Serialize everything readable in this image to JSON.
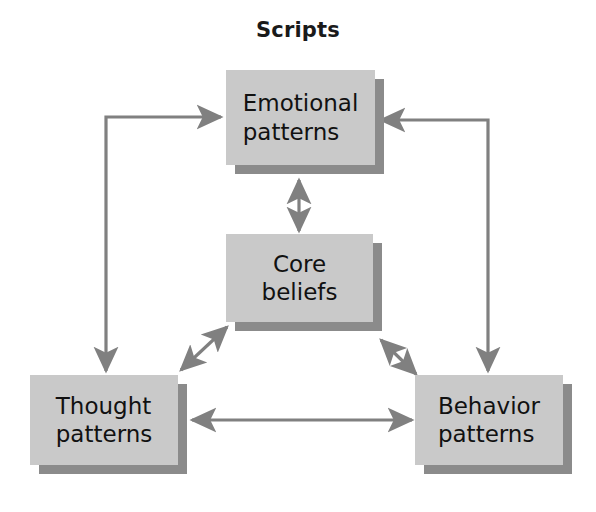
{
  "diagram": {
    "title": "Scripts",
    "type": "cycle-diagram",
    "colors": {
      "box_fill": "#c9c9c9",
      "box_shadow": "#8b8b8b",
      "arrow": "#808080",
      "text": "#111111",
      "background": "#ffffff"
    },
    "nodes": [
      {
        "id": "emotional",
        "label": "Emotional\npatterns",
        "x": 226,
        "y": 70,
        "width": 149,
        "height": 95
      },
      {
        "id": "core",
        "label": "Core\nbeliefs",
        "x": 226,
        "y": 234,
        "width": 147,
        "height": 88
      },
      {
        "id": "thought",
        "label": "Thought\npatterns",
        "x": 30,
        "y": 375,
        "width": 148,
        "height": 90
      },
      {
        "id": "behavior",
        "label": "Behavior\npatterns",
        "x": 415,
        "y": 375,
        "width": 148,
        "height": 90
      }
    ],
    "connectors": [
      {
        "id": "emotional-to-thought",
        "from": "emotional",
        "to": "thought",
        "style": "elbow",
        "heads": "both-ends",
        "description": "left elbow connector: arrow into Emotional patterns left side and arrow down into Thought patterns top"
      },
      {
        "id": "behavior-to-emotional",
        "from": "behavior",
        "to": "emotional",
        "style": "elbow",
        "heads": "both-ends",
        "description": "right elbow connector: arrow into Emotional patterns right side and arrow down into Behavior patterns top"
      },
      {
        "id": "emotional-core",
        "from": "emotional",
        "to": "core",
        "style": "straight-vertical",
        "heads": "double",
        "description": "vertical double-headed arrow between Emotional patterns and Core beliefs"
      },
      {
        "id": "core-thought",
        "from": "core",
        "to": "thought",
        "style": "diagonal",
        "heads": "double",
        "description": "diagonal double-headed arrow between Core beliefs and Thought patterns"
      },
      {
        "id": "core-behavior",
        "from": "core",
        "to": "behavior",
        "style": "diagonal",
        "heads": "double",
        "description": "diagonal double-headed arrow between Core beliefs and Behavior patterns"
      },
      {
        "id": "thought-behavior",
        "from": "thought",
        "to": "behavior",
        "style": "straight-horizontal",
        "heads": "double",
        "description": "horizontal double-headed arrow between Thought patterns and Behavior patterns"
      }
    ]
  }
}
